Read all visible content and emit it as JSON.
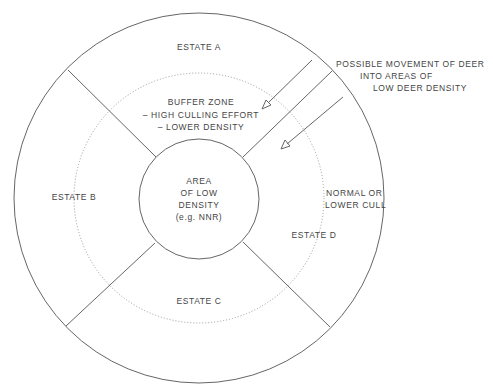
{
  "diagram": {
    "estates": {
      "a": "ESTATE A",
      "b": "ESTATE B",
      "c": "ESTATE C",
      "d": "ESTATE D"
    },
    "buffer_zone": {
      "line1": "BUFFER ZONE",
      "line2": "– HIGH CULLING EFFORT",
      "line3": "– LOWER DENSITY"
    },
    "core_area": {
      "line1": "AREA",
      "line2": "OF LOW",
      "line3": "DENSITY",
      "line4": "(e.g. NNR)"
    },
    "outer_note": {
      "line1": "NORMAL OR",
      "line2": "LOWER CULL"
    },
    "movement_note": {
      "line1": "POSSIBLE MOVEMENT OF DEER",
      "line2": "INTO AREAS OF",
      "line3": "LOW DEER DENSITY"
    },
    "colors": {
      "line": "#666666",
      "dotted": "#999999",
      "text": "#444444"
    }
  }
}
